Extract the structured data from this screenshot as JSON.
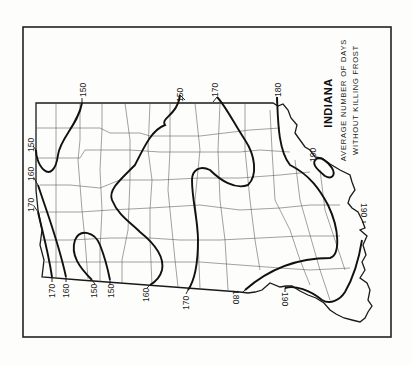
{
  "map": {
    "title": "INDIANA",
    "subtitle_line1": "AVERAGE NUMBER OF DAYS",
    "subtitle_line2": "WITHOUT KILLING FROST",
    "orientation": "rotated 90° counter-clockwise (north at left)",
    "isolines": [
      {
        "id": "iso-150-north",
        "label": "150"
      },
      {
        "id": "iso-150-northwest",
        "label": "150"
      },
      {
        "id": "iso-160-west",
        "label": "160"
      },
      {
        "id": "iso-170-west",
        "label": "170"
      },
      {
        "id": "iso-150-top-loop",
        "label": "150"
      },
      {
        "id": "iso-160-central",
        "label": "160"
      },
      {
        "id": "iso-170-central",
        "label": "170"
      },
      {
        "id": "iso-180",
        "label": "180"
      },
      {
        "id": "iso-190-southeast",
        "label": "190"
      },
      {
        "id": "iso-190-south",
        "label": "190"
      },
      {
        "id": "iso-190-east",
        "label": "190"
      }
    ],
    "labels": {
      "top_150_a": "150",
      "top_150_b": "150",
      "top_170": "170",
      "top_180": "180",
      "left_150": "150",
      "left_160": "160",
      "left_170": "170",
      "bottom_170_a": "170",
      "bottom_160_a": "160",
      "bottom_150_a": "150",
      "bottom_150_b": "150",
      "bottom_160_b": "160",
      "bottom_170_b": "170",
      "bottom_180": "180",
      "bottom_190": "190",
      "right_190": "190",
      "inner_190": "190"
    }
  }
}
